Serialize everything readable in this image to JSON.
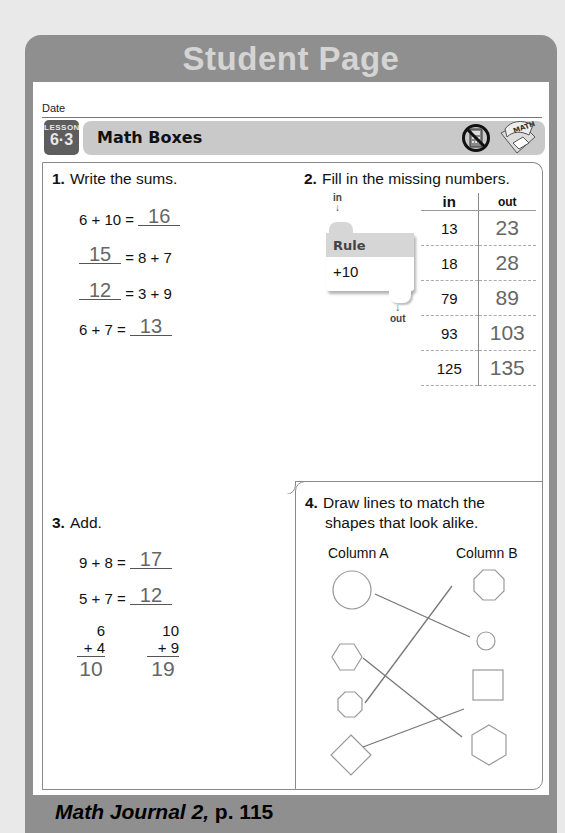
{
  "header": {
    "title": "Student Page"
  },
  "date": {
    "label": "Date"
  },
  "lesson": {
    "label": "LESSON",
    "number": "6·3",
    "title": "Math Boxes",
    "icons": [
      "no-calculator-icon",
      "math-journal-icon"
    ]
  },
  "problems": {
    "p1": {
      "number": "1.",
      "instruction": "Write the sums.",
      "equations": [
        {
          "left": "6 + 10 =",
          "answer": "16",
          "right": ""
        },
        {
          "left": "",
          "answer": "15",
          "right": "= 8 + 7"
        },
        {
          "left": "",
          "answer": "12",
          "right": "= 3 + 9"
        },
        {
          "left": "6 + 7 =",
          "answer": "13",
          "right": ""
        }
      ]
    },
    "p2": {
      "number": "2.",
      "instruction": "Fill in the missing numbers.",
      "rule": {
        "in_label": "in",
        "out_label": "out",
        "title": "Rule",
        "value": "+10"
      },
      "table": {
        "headers": [
          "in",
          "out"
        ],
        "rows": [
          {
            "in": "13",
            "out": "23"
          },
          {
            "in": "18",
            "out": "28"
          },
          {
            "in": "79",
            "out": "89"
          },
          {
            "in": "93",
            "out": "103"
          },
          {
            "in": "125",
            "out": "135"
          }
        ]
      }
    },
    "p3": {
      "number": "3.",
      "instruction": "Add.",
      "equations": [
        {
          "left": "9 + 8 =",
          "answer": "17"
        },
        {
          "left": "5 + 7 =",
          "answer": "12"
        }
      ],
      "vertical": [
        {
          "top": "6",
          "bottom": "+ 4",
          "answer": "10"
        },
        {
          "top": "10",
          "bottom": "+ 9",
          "answer": "19"
        }
      ]
    },
    "p4": {
      "number": "4.",
      "instruction_line1": "Draw lines to match the",
      "instruction_line2": "shapes that look alike.",
      "column_a": {
        "label": "Column A",
        "shapes": [
          "circle-large",
          "hexagon",
          "octagon",
          "diamond"
        ]
      },
      "column_b": {
        "label": "Column B",
        "shapes": [
          "octagon",
          "circle-small",
          "square",
          "hexagon"
        ]
      },
      "matches": [
        {
          "a": "circle-large",
          "b": "circle-small"
        },
        {
          "a": "hexagon",
          "b": "hexagon"
        },
        {
          "a": "octagon",
          "b": "octagon"
        },
        {
          "a": "diamond",
          "b": "square"
        }
      ]
    }
  },
  "footer": {
    "journal_title": "Math Journal 2,",
    "page_ref": " p. 115"
  },
  "colors": {
    "frame_gray": "#8f8f8f",
    "header_text": "#d4d4d4",
    "lesson_bar": "#c9c9c9",
    "lesson_badge": "#5d5d5d",
    "answer_gray": "#666666"
  }
}
